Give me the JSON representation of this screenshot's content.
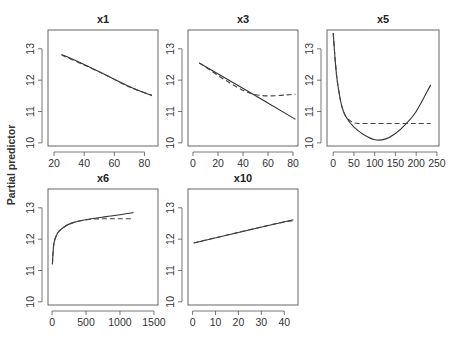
{
  "figure": {
    "ylabel": "Partial predictor"
  },
  "chart_data": [
    {
      "type": "line",
      "title": "x1",
      "xlabel": "",
      "ylabel": "Partial predictor",
      "xticks": [
        20,
        40,
        60,
        80
      ],
      "yticks": [
        10,
        11,
        12,
        13
      ],
      "xlim": [
        16,
        89
      ],
      "ylim": [
        9.9,
        13.6
      ],
      "grid": false,
      "series": [
        {
          "name": "fitted",
          "style": "solid",
          "x": [
            25,
            40,
            55,
            70,
            85
          ],
          "y": [
            12.82,
            12.5,
            12.15,
            11.8,
            11.5
          ]
        },
        {
          "name": "comparison",
          "style": "dashed",
          "x": [
            25,
            40,
            55,
            70,
            85
          ],
          "y": [
            12.8,
            12.48,
            12.15,
            11.78,
            11.52
          ]
        }
      ]
    },
    {
      "type": "line",
      "title": "x3",
      "xlabel": "",
      "ylabel": "Partial predictor",
      "xticks": [
        0,
        20,
        40,
        60,
        80
      ],
      "yticks": [
        10,
        11,
        12,
        13
      ],
      "xlim": [
        -4,
        84
      ],
      "ylim": [
        9.9,
        13.6
      ],
      "grid": false,
      "series": [
        {
          "name": "fitted",
          "style": "solid",
          "x": [
            5,
            46,
            82
          ],
          "y": [
            12.55,
            11.6,
            10.75
          ]
        },
        {
          "name": "comparison",
          "style": "dashed",
          "x": [
            5,
            46,
            82
          ],
          "y": [
            12.55,
            11.58,
            11.55
          ]
        }
      ]
    },
    {
      "type": "line",
      "title": "x5",
      "xlabel": "",
      "ylabel": "Partial predictor",
      "xticks": [
        0,
        50,
        100,
        150,
        200,
        250
      ],
      "yticks": [
        10,
        11,
        12,
        13
      ],
      "xlim": [
        -15,
        255
      ],
      "ylim": [
        9.9,
        13.6
      ],
      "grid": false,
      "series": [
        {
          "name": "fitted",
          "style": "solid",
          "x": [
            0,
            5,
            10,
            20,
            30,
            50,
            75,
            100,
            125,
            150,
            175,
            200,
            235
          ],
          "y": [
            13.5,
            12.6,
            11.95,
            11.2,
            10.85,
            10.5,
            10.25,
            10.1,
            10.12,
            10.3,
            10.6,
            11.0,
            11.85
          ]
        },
        {
          "name": "comparison",
          "style": "dashed",
          "x": [
            0,
            5,
            10,
            20,
            30,
            45,
            60,
            100,
            150,
            200,
            235
          ],
          "y": [
            13.5,
            12.6,
            11.95,
            11.2,
            10.85,
            10.67,
            10.62,
            10.62,
            10.62,
            10.62,
            10.62
          ]
        }
      ]
    },
    {
      "type": "line",
      "title": "x6",
      "xlabel": "",
      "ylabel": "Partial predictor",
      "xticks": [
        0,
        500,
        1000,
        1500
      ],
      "yticks": [
        10,
        11,
        12,
        13
      ],
      "xlim": [
        -60,
        1560
      ],
      "ylim": [
        9.9,
        13.6
      ],
      "grid": false,
      "series": [
        {
          "name": "fitted",
          "style": "solid",
          "x": [
            5,
            15,
            30,
            60,
            100,
            200,
            300,
            400,
            600,
            800,
            1000,
            1200
          ],
          "y": [
            11.2,
            11.6,
            11.9,
            12.1,
            12.25,
            12.42,
            12.52,
            12.58,
            12.66,
            12.72,
            12.78,
            12.85
          ]
        },
        {
          "name": "comparison",
          "style": "dashed",
          "x": [
            5,
            15,
            30,
            60,
            100,
            200,
            300,
            400,
            600,
            800,
            1000,
            1200
          ],
          "y": [
            11.2,
            11.6,
            11.9,
            12.1,
            12.25,
            12.42,
            12.52,
            12.58,
            12.64,
            12.65,
            12.65,
            12.65
          ]
        }
      ]
    },
    {
      "type": "line",
      "title": "x10",
      "xlabel": "",
      "ylabel": "Partial predictor",
      "xticks": [
        0,
        10,
        20,
        30,
        40
      ],
      "yticks": [
        10,
        11,
        12,
        13
      ],
      "xlim": [
        -2,
        46
      ],
      "ylim": [
        9.9,
        13.6
      ],
      "grid": false,
      "series": [
        {
          "name": "fitted",
          "style": "solid",
          "x": [
            0.5,
            44
          ],
          "y": [
            11.88,
            12.62
          ]
        },
        {
          "name": "comparison",
          "style": "dashed",
          "x": [
            0.5,
            38,
            44
          ],
          "y": [
            11.88,
            12.52,
            12.55
          ]
        }
      ]
    }
  ]
}
